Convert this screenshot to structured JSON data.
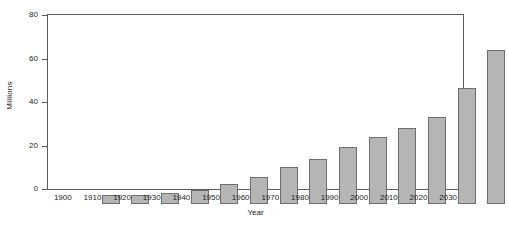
{
  "chart_data": {
    "type": "bar",
    "title": "",
    "xlabel": "Year",
    "ylabel": "Millions",
    "categories": [
      "1900",
      "1910",
      "1920",
      "1930",
      "1940",
      "1950",
      "1960",
      "1970",
      "1980",
      "1990",
      "2000",
      "2010",
      "2020",
      "2030"
    ],
    "values": [
      4,
      4,
      5,
      6.5,
      9,
      12.5,
      17,
      20.5,
      26,
      31,
      35,
      40,
      53.5,
      71
    ],
    "ylim": [
      0,
      80
    ],
    "yticks": [
      0,
      20,
      40,
      60,
      80
    ],
    "ytick_labels": [
      "0",
      "20",
      "40",
      "60",
      "80"
    ],
    "grid": false,
    "legend": "none",
    "bar_fill_color": "#b5b5b5",
    "bar_edge_color": "#6e6e6e",
    "axis_color": "#5c5c5c",
    "background_color": "#ffffff"
  }
}
